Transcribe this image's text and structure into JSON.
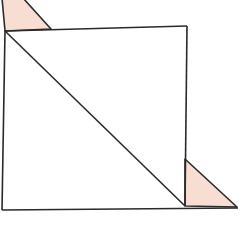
{
  "diagram": {
    "colors": {
      "stroke": "#2a2a2a",
      "fill_shaded": "#f8ddd3",
      "background": "#ffffff"
    },
    "square": {
      "points": [
        [
          5,
          31
        ],
        [
          187,
          26
        ],
        [
          185,
          207
        ],
        [
          2,
          209
        ]
      ]
    },
    "diagonal": {
      "from": [
        5,
        31
      ],
      "to": [
        185,
        205
      ]
    },
    "triangles": [
      {
        "name": "top-left-triangle",
        "points": [
          [
            2,
            -2
          ],
          [
            5,
            31
          ],
          [
            51,
            29
          ],
          [
            23,
            -2
          ]
        ]
      },
      {
        "name": "bottom-right-triangle",
        "points": [
          [
            185,
            159
          ],
          [
            185,
            205
          ],
          [
            237,
            207
          ]
        ]
      }
    ]
  }
}
